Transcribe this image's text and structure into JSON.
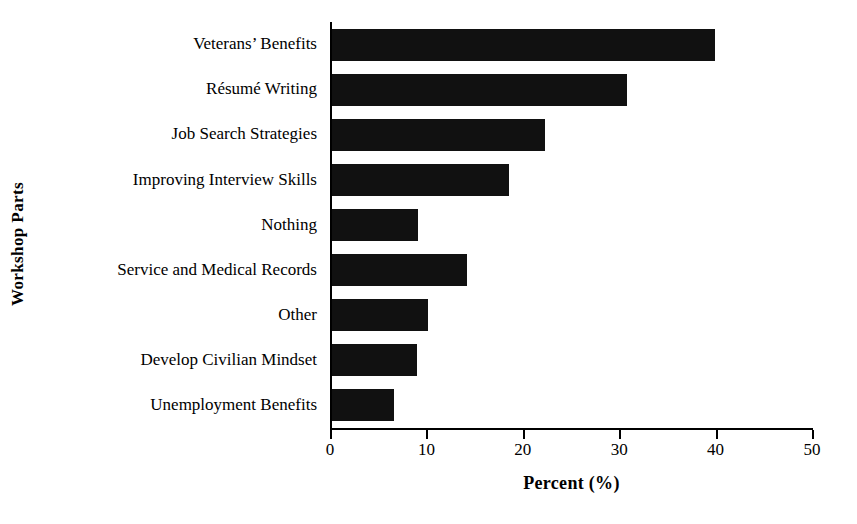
{
  "chart_data": {
    "type": "bar",
    "orientation": "horizontal",
    "title": "",
    "xlabel": "Percent (%)",
    "ylabel": "Workshop Parts",
    "xlim": [
      0,
      50
    ],
    "xticks": [
      0,
      10,
      20,
      30,
      40,
      50
    ],
    "xtick_labels": [
      "0",
      "10",
      "20",
      "30",
      "40",
      "50"
    ],
    "grid": false,
    "legend": false,
    "bar_color": "#111111",
    "background_color": "#ffffff",
    "categories": [
      "Veterans’ Benefits",
      "Résumé Writing",
      "Job Search Strategies",
      "Improving Interview Skills",
      "Nothing",
      "Service and Medical Records",
      "Other",
      "Develop Civilian Mindset",
      "Unemployment Benefits"
    ],
    "values": [
      39.7,
      30.6,
      22.1,
      18.4,
      8.9,
      14.0,
      10.0,
      8.8,
      6.4
    ]
  }
}
